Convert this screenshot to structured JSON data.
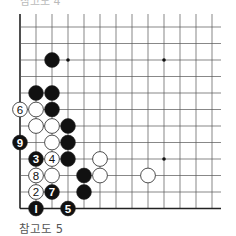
{
  "caption": "참고도 5",
  "top_caption_fragment": "참고도 4",
  "board": {
    "cols": 13,
    "rows": 12,
    "origin_x": 20,
    "origin_y": 27,
    "spacing_x": 16,
    "spacing_y": 16.5,
    "right_extent": 221,
    "edges": [
      "left",
      "bottom"
    ],
    "line_color": "#555555",
    "edge_color": "#222222",
    "star_points": [
      [
        3,
        2
      ],
      [
        9,
        2
      ],
      [
        9,
        8
      ]
    ],
    "stones": [
      {
        "col": 2,
        "row": 2,
        "color": "black",
        "label": ""
      },
      {
        "col": 1,
        "row": 4,
        "color": "black",
        "label": ""
      },
      {
        "col": 2,
        "row": 4,
        "color": "black",
        "label": ""
      },
      {
        "col": 0,
        "row": 5,
        "color": "white",
        "label": "6"
      },
      {
        "col": 1,
        "row": 5,
        "color": "white",
        "label": ""
      },
      {
        "col": 2,
        "row": 5,
        "color": "black",
        "label": ""
      },
      {
        "col": 1,
        "row": 6,
        "color": "white",
        "label": ""
      },
      {
        "col": 2,
        "row": 6,
        "color": "white",
        "label": ""
      },
      {
        "col": 3,
        "row": 6,
        "color": "black",
        "label": ""
      },
      {
        "col": 0,
        "row": 7,
        "color": "black",
        "label": "9"
      },
      {
        "col": 2,
        "row": 7,
        "color": "white",
        "label": ""
      },
      {
        "col": 3,
        "row": 7,
        "color": "black",
        "label": ""
      },
      {
        "col": 1,
        "row": 8,
        "color": "black",
        "label": "3"
      },
      {
        "col": 2,
        "row": 8,
        "color": "white",
        "label": "4"
      },
      {
        "col": 3,
        "row": 8,
        "color": "black",
        "label": ""
      },
      {
        "col": 5,
        "row": 8,
        "color": "white",
        "label": ""
      },
      {
        "col": 1,
        "row": 9,
        "color": "white",
        "label": "8"
      },
      {
        "col": 2,
        "row": 9,
        "color": "white",
        "label": ""
      },
      {
        "col": 4,
        "row": 9,
        "color": "black",
        "label": ""
      },
      {
        "col": 5,
        "row": 9,
        "color": "white",
        "label": ""
      },
      {
        "col": 8,
        "row": 9,
        "color": "white",
        "label": ""
      },
      {
        "col": 1,
        "row": 10,
        "color": "white",
        "label": "2"
      },
      {
        "col": 2,
        "row": 10,
        "color": "black",
        "label": "7"
      },
      {
        "col": 4,
        "row": 10,
        "color": "black",
        "label": ""
      },
      {
        "col": 1,
        "row": 11,
        "color": "black",
        "label": "1"
      },
      {
        "col": 3,
        "row": 11,
        "color": "black",
        "label": "5"
      }
    ]
  }
}
